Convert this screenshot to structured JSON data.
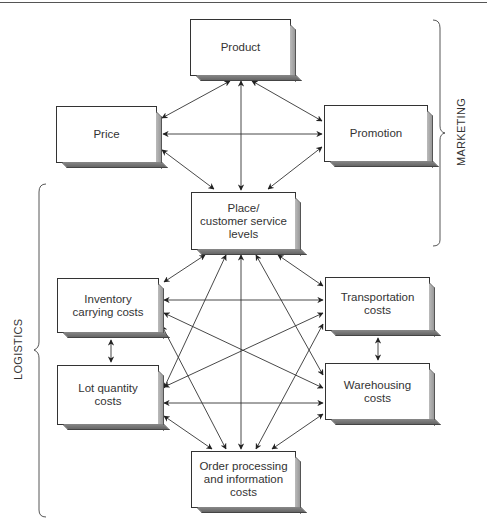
{
  "diagram": {
    "type": "relationship-diagram",
    "nodes": [
      {
        "id": "product",
        "label": "Product"
      },
      {
        "id": "price",
        "label": "Price"
      },
      {
        "id": "promotion",
        "label": "Promotion"
      },
      {
        "id": "place",
        "label": "Place/\ncustomer service\nlevels"
      },
      {
        "id": "inventory",
        "label": "Inventory\ncarrying costs"
      },
      {
        "id": "transportation",
        "label": "Transportation\ncosts"
      },
      {
        "id": "lot",
        "label": "Lot quantity\ncosts"
      },
      {
        "id": "warehousing",
        "label": "Warehousing\ncosts"
      },
      {
        "id": "order",
        "label": "Order processing\nand information\ncosts"
      }
    ],
    "groups": [
      {
        "id": "marketing",
        "label": "MARKETING",
        "members": [
          "product",
          "price",
          "promotion",
          "place"
        ]
      },
      {
        "id": "logistics",
        "label": "LOGISTICS",
        "members": [
          "place",
          "inventory",
          "transportation",
          "lot",
          "warehousing",
          "order"
        ]
      }
    ],
    "edges_note": "All edges are bidirectional arrows",
    "edges": [
      [
        "product",
        "price"
      ],
      [
        "product",
        "promotion"
      ],
      [
        "product",
        "place"
      ],
      [
        "price",
        "promotion"
      ],
      [
        "price",
        "place"
      ],
      [
        "promotion",
        "place"
      ],
      [
        "place",
        "inventory"
      ],
      [
        "place",
        "transportation"
      ],
      [
        "place",
        "lot"
      ],
      [
        "place",
        "warehousing"
      ],
      [
        "place",
        "order"
      ],
      [
        "inventory",
        "transportation"
      ],
      [
        "inventory",
        "lot"
      ],
      [
        "inventory",
        "warehousing"
      ],
      [
        "inventory",
        "order"
      ],
      [
        "transportation",
        "lot"
      ],
      [
        "transportation",
        "warehousing"
      ],
      [
        "transportation",
        "order"
      ],
      [
        "lot",
        "warehousing"
      ],
      [
        "lot",
        "order"
      ],
      [
        "warehousing",
        "order"
      ]
    ]
  }
}
